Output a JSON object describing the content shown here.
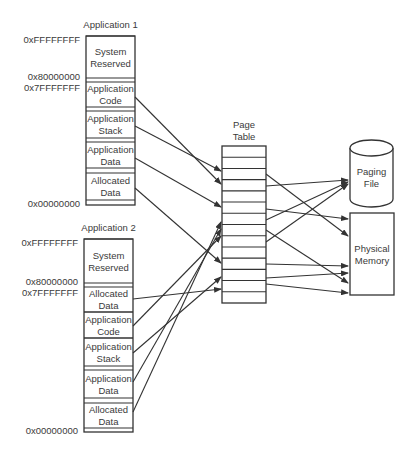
{
  "diagram": {
    "applications": [
      {
        "title": "Application 1",
        "box": {
          "x": 86,
          "y": 36,
          "w": 49
        },
        "addresses": [
          {
            "label": "0xFFFFFFFF",
            "y": 40
          },
          {
            "label": "0x80000000",
            "y": 77
          },
          {
            "label": "0x7FFFFFFF",
            "y": 88
          },
          {
            "label": "0x00000000",
            "y": 204
          }
        ],
        "segments": [
          {
            "label": [
              "System",
              "Reserved"
            ],
            "y": 36,
            "h": 42,
            "band_after": 4
          },
          {
            "label": [
              "Application",
              "Code"
            ],
            "y": 82,
            "h": 25,
            "band_after": 4
          },
          {
            "label": [
              "Application",
              "Stack"
            ],
            "y": 111,
            "h": 27,
            "band_after": 4
          },
          {
            "label": [
              "Application",
              "Data"
            ],
            "y": 142,
            "h": 26,
            "band_after": 5
          },
          {
            "label": [
              "Allocated",
              "Data"
            ],
            "y": 173,
            "h": 27,
            "band_after": 5
          }
        ]
      },
      {
        "title": "Application 2",
        "box": {
          "x": 84,
          "y": 239,
          "w": 49
        },
        "addresses": [
          {
            "label": "0xFFFFFFFF",
            "y": 243
          },
          {
            "label": "0x80000000",
            "y": 282
          },
          {
            "label": "0x7FFFFFFF",
            "y": 293
          },
          {
            "label": "0x00000000",
            "y": 431
          }
        ],
        "segments": [
          {
            "label": [
              "System",
              "Reserved"
            ],
            "y": 239,
            "h": 44,
            "band_after": 4
          },
          {
            "label": [
              "Allocated",
              "Data"
            ],
            "y": 287,
            "h": 25,
            "band_after": 0
          },
          {
            "label": [
              "Application",
              "Code"
            ],
            "y": 312,
            "h": 26,
            "band_after": 0
          },
          {
            "label": [
              "Application",
              "Stack"
            ],
            "y": 338,
            "h": 28,
            "band_after": 4
          },
          {
            "label": [
              "Application",
              "Data"
            ],
            "y": 370,
            "h": 28,
            "band_after": 5
          },
          {
            "label": [
              "Allocated",
              "Data"
            ],
            "y": 403,
            "h": 25,
            "band_after": 4
          }
        ]
      }
    ],
    "page_table": {
      "title": [
        "Page",
        "Table"
      ],
      "x": 222,
      "y": 146,
      "w": 44,
      "h": 157,
      "rows": 14
    },
    "paging_file": {
      "label": [
        "Paging",
        "File"
      ],
      "x": 350,
      "y": 140,
      "w": 43,
      "h": 67
    },
    "physical_memory": {
      "label": [
        "Physical",
        "Memory"
      ],
      "x": 350,
      "y": 213,
      "w": 44,
      "h": 82
    },
    "arrows_to_table": [
      {
        "from": "App1 Application Code",
        "x1": 135,
        "y1": 97,
        "x2": 221,
        "y2": 184
      },
      {
        "from": "App1 Application Stack",
        "x1": 135,
        "y1": 126,
        "x2": 221,
        "y2": 171
      },
      {
        "from": "App1 Application Data",
        "x1": 135,
        "y1": 158,
        "x2": 221,
        "y2": 207
      },
      {
        "from": "App1 Allocated Data",
        "x1": 135,
        "y1": 188,
        "x2": 221,
        "y2": 263
      },
      {
        "from": "App2 Allocated Data",
        "x1": 133,
        "y1": 299,
        "x2": 221,
        "y2": 289
      },
      {
        "from": "App2 Application Code",
        "x1": 133,
        "y1": 326,
        "x2": 221,
        "y2": 236
      },
      {
        "from": "App2 Application Stack",
        "x1": 133,
        "y1": 353,
        "x2": 221,
        "y2": 277
      },
      {
        "from": "App2 Application Data",
        "x1": 133,
        "y1": 382,
        "x2": 221,
        "y2": 229
      },
      {
        "from": "App2 Allocated Data",
        "x1": 133,
        "y1": 412,
        "x2": 221,
        "y2": 222
      }
    ],
    "arrows_from_table": [
      {
        "to": "Physical Memory",
        "x1": 266,
        "y1": 174,
        "x2": 348,
        "y2": 236
      },
      {
        "to": "Paging File",
        "x1": 266,
        "y1": 186,
        "x2": 348,
        "y2": 180
      },
      {
        "to": "Physical Memory",
        "x1": 266,
        "y1": 209,
        "x2": 348,
        "y2": 219
      },
      {
        "to": "Paging File",
        "x1": 266,
        "y1": 220,
        "x2": 348,
        "y2": 182
      },
      {
        "to": "Physical Memory",
        "x1": 266,
        "y1": 230,
        "x2": 348,
        "y2": 283
      },
      {
        "to": "Paging File",
        "x1": 266,
        "y1": 242,
        "x2": 348,
        "y2": 184
      },
      {
        "to": "Physical Memory",
        "x1": 266,
        "y1": 264,
        "x2": 348,
        "y2": 266
      },
      {
        "to": "Physical Memory",
        "x1": 266,
        "y1": 278,
        "x2": 348,
        "y2": 273
      },
      {
        "to": "Physical Memory",
        "x1": 266,
        "y1": 284,
        "x2": 348,
        "y2": 293
      }
    ]
  }
}
